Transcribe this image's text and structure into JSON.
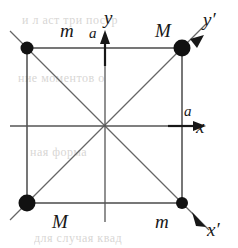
{
  "figure": {
    "background_color": "#ffffff",
    "ink_color": "#171717",
    "line_color": "#555555",
    "masses": [
      {
        "id": "top-left",
        "label": "m",
        "kind": "small",
        "x": 27,
        "y": 48,
        "radius": 6.5
      },
      {
        "id": "top-right",
        "label": "M",
        "kind": "large",
        "x": 182,
        "y": 48,
        "radius": 8.5
      },
      {
        "id": "bottom-left",
        "label": "M",
        "kind": "large",
        "x": 27,
        "y": 203,
        "radius": 8.5
      },
      {
        "id": "bottom-right",
        "label": "m",
        "kind": "small",
        "x": 182,
        "y": 203,
        "radius": 6.0
      }
    ],
    "axes": [
      {
        "id": "x",
        "label": "x",
        "direction": "right"
      },
      {
        "id": "y",
        "label": "y",
        "direction": "up"
      },
      {
        "id": "xp",
        "label": "x′",
        "direction": "down-right"
      },
      {
        "id": "yp",
        "label": "y′",
        "direction": "up-right"
      }
    ],
    "side_length_labels": [
      {
        "id": "side-a-x",
        "label": "a"
      },
      {
        "id": "side-a-y",
        "label": "a"
      }
    ],
    "center": {
      "x": 105,
      "y": 126
    },
    "square": {
      "left": 27,
      "top": 48,
      "right": 182,
      "bottom": 203
    }
  },
  "bleed_through": [
    {
      "id": "ghost-top",
      "text": "и л аст три постр"
    },
    {
      "id": "ghost-mid",
      "text": "ние моментов о"
    },
    {
      "id": "ghost-lower",
      "text": "ная форма"
    },
    {
      "id": "ghost-bottom",
      "text": "для случая квад"
    }
  ]
}
